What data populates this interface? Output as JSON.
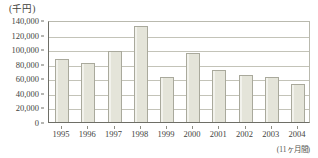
{
  "chart_data": {
    "type": "bar",
    "title": "",
    "unit_label": "(千円)",
    "xlabel": "",
    "ylabel": "",
    "categories": [
      "1995",
      "1996",
      "1997",
      "1998",
      "1999",
      "2000",
      "2001",
      "2002",
      "2003",
      "2004"
    ],
    "values": [
      86000,
      81000,
      98000,
      132000,
      62000,
      95000,
      72000,
      64000,
      62000,
      52000
    ],
    "ylim": [
      0,
      140000
    ],
    "ytick_step": 20000,
    "ytick_labels": [
      "140,000",
      "120,000",
      "100,000",
      "80,000",
      "60,000",
      "40,000",
      "20,000",
      "0"
    ],
    "ytick_values": [
      140000,
      120000,
      100000,
      80000,
      60000,
      40000,
      20000,
      0
    ],
    "grid": true,
    "legend": false,
    "legend_position": "none",
    "annotations": [
      "(11ヶ月間)"
    ],
    "bar_fill_color": "#e4e4d9",
    "bar_border_color": "#a9a99c",
    "grid_color": "#c3c3b8",
    "axis_color": "#6e6e66",
    "text_color": "#43433e"
  },
  "footnote": "(11ヶ月間)"
}
